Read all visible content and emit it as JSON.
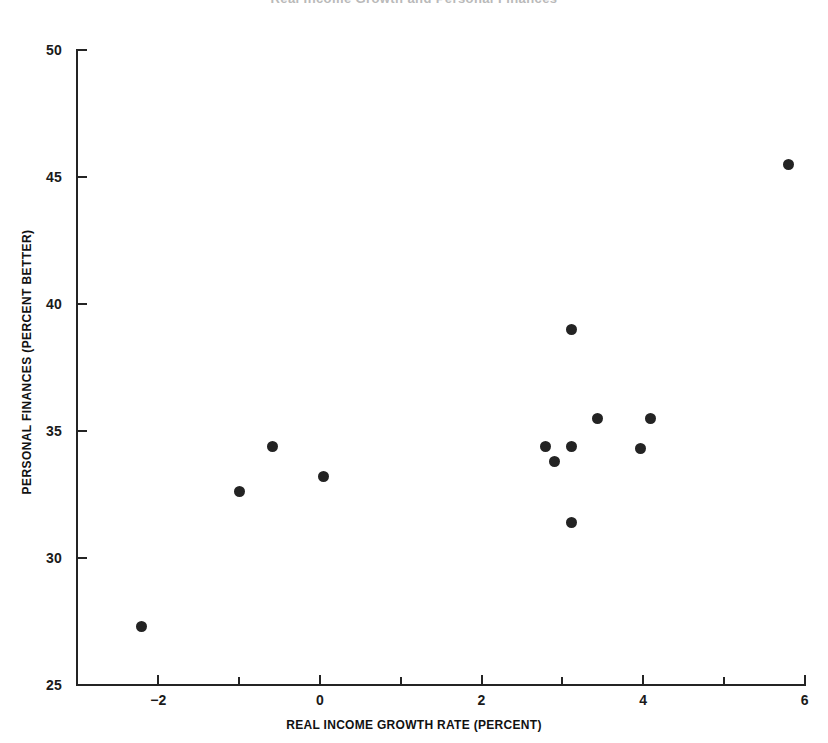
{
  "figure": {
    "clipped_header_text": "Real Income Growth and Personal Finances"
  },
  "axes": {
    "x_title": "REAL INCOME GROWTH RATE (PERCENT)",
    "y_title": "PERSONAL FINANCES (PERCENT BETTER)",
    "x_ticks_major": [
      "-2",
      "0",
      "2",
      "4",
      "6"
    ],
    "x_ticks_minor": [
      "-1",
      "1",
      "3",
      "5"
    ],
    "y_ticks": [
      "50",
      "45",
      "40",
      "35",
      "30",
      "25"
    ]
  },
  "colors": {
    "marker": "#232323",
    "axis": "#242424",
    "text": "#111111",
    "background": "#ffffff"
  },
  "chart_data": {
    "type": "scatter",
    "title": "",
    "xlabel": "REAL INCOME GROWTH RATE (PERCENT)",
    "ylabel": "PERSONAL FINANCES (PERCENT BETTER)",
    "xlim": [
      -2.8,
      6.0
    ],
    "ylim": [
      25,
      50
    ],
    "xticks": [
      -2,
      0,
      2,
      4,
      6
    ],
    "xticks_minor": [
      -1,
      1,
      3,
      5
    ],
    "yticks": [
      25,
      30,
      35,
      40,
      45,
      50
    ],
    "grid": false,
    "legend": null,
    "series": [
      {
        "name": "Annual observations",
        "points": [
          {
            "x": -2.21,
            "y": 27.3
          },
          {
            "x": -1.0,
            "y": 32.6
          },
          {
            "x": -0.59,
            "y": 34.4
          },
          {
            "x": 0.04,
            "y": 33.2
          },
          {
            "x": 2.79,
            "y": 34.4
          },
          {
            "x": 2.9,
            "y": 33.8
          },
          {
            "x": 3.11,
            "y": 34.4
          },
          {
            "x": 3.11,
            "y": 39.0
          },
          {
            "x": 3.11,
            "y": 31.4
          },
          {
            "x": 3.43,
            "y": 35.5
          },
          {
            "x": 3.97,
            "y": 34.3
          },
          {
            "x": 4.09,
            "y": 35.5
          },
          {
            "x": 5.8,
            "y": 45.5
          }
        ]
      }
    ]
  }
}
